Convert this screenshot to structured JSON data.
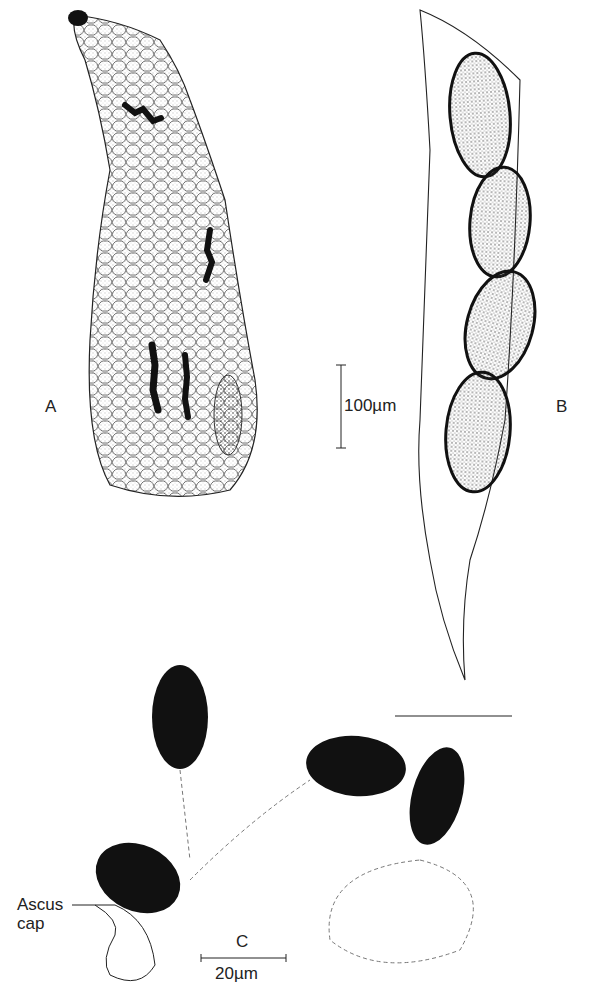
{
  "figure": {
    "panels": [
      {
        "id": "A",
        "label": "A",
        "description": "Perithecium / ascoma with ostiole and ascus clusters"
      },
      {
        "id": "B",
        "label": "B",
        "description": "Ascus containing four ascospores"
      },
      {
        "id": "C",
        "label": "C",
        "description": "Released ascospores with ascus cap"
      }
    ],
    "scale_bars": {
      "a": "100µm",
      "c": "20µm"
    },
    "annotations": {
      "ascus_cap": "Ascus\ncap",
      "ascus_cap_line1": "Ascus",
      "ascus_cap_line2": "cap"
    },
    "colors": {
      "ink": "#1a1a1a",
      "paper": "#ffffff"
    }
  }
}
